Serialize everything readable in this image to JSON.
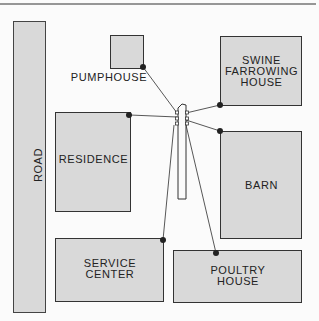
{
  "diagram": {
    "type": "farm electrical service layout",
    "colors": {
      "building_fill": "#d9d9d9",
      "outline": "#333333",
      "background": "#fbfbfb",
      "wire": "#444444",
      "dot": "#222222"
    },
    "road": {
      "label": "ROAD"
    },
    "buildings": [
      {
        "id": "pumphouse",
        "label": "PUMPHOUSE"
      },
      {
        "id": "swine",
        "label_lines": [
          "SWINE",
          "FARROWING",
          "HOUSE"
        ]
      },
      {
        "id": "residence",
        "label": "RESIDENCE"
      },
      {
        "id": "barn",
        "label": "BARN"
      },
      {
        "id": "service",
        "label_lines": [
          "SERVICE",
          "CENTER"
        ]
      },
      {
        "id": "poultry",
        "label_lines": [
          "POULTRY",
          "HOUSE"
        ]
      }
    ],
    "pole": {
      "label": "distribution pole"
    }
  }
}
